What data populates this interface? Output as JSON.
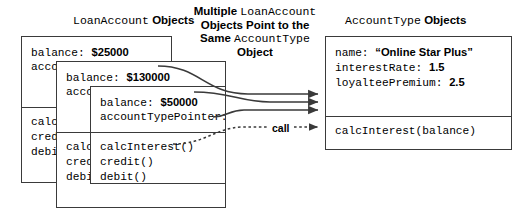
{
  "diagram": {
    "title_left": {
      "code": "LoanAccount",
      "plain": "Objects"
    },
    "title_right": {
      "code": "AccountType",
      "plain": "Objects"
    },
    "caption": {
      "line1_bold": "Multiple ",
      "line1_code": "LoanAccount",
      "line2": "Objects Point to the",
      "line3_bold": "Same ",
      "line3_code": "AccountType",
      "line4": "Object"
    },
    "call_label": "call",
    "loan_accounts": [
      {
        "balance_label": "balance: ",
        "balance_value": "$25000",
        "pointer_label": "accountTypePointer:",
        "methods": [
          "calcInterest()",
          "credit()",
          "debit()"
        ]
      },
      {
        "balance_label": "balance: ",
        "balance_value": "$130000",
        "pointer_label": "accountTypePointer:",
        "methods": [
          "calcInterest()",
          "credit()",
          "debit()"
        ]
      },
      {
        "balance_label": "balance: ",
        "balance_value": "$50000",
        "pointer_label": "accountTypePointer:",
        "methods": [
          "calcInterest()",
          "credit()",
          "debit()"
        ]
      }
    ],
    "account_type": {
      "fields": [
        {
          "label": "name: ",
          "value": "“Online Star Plus”"
        },
        {
          "label": "interestRate: ",
          "value": "1.5"
        },
        {
          "label": "loyalteePremium: ",
          "value": "2.5"
        }
      ],
      "methods": [
        "calcInterest(balance)"
      ]
    },
    "colors": {
      "stroke": "#3a3a3a",
      "arrow": "#3a3a3a",
      "text": "#000000",
      "background": "#ffffff"
    }
  }
}
